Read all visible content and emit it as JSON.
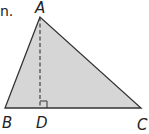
{
  "caption_fragment": "n.",
  "diagram": {
    "type": "triangle-with-altitude",
    "vertices": {
      "A": {
        "label": "A",
        "x": 40,
        "y": 17
      },
      "B": {
        "label": "B",
        "x": 5,
        "y": 108
      },
      "C": {
        "label": "C",
        "x": 141,
        "y": 108
      },
      "D": {
        "label": "D",
        "x": 40,
        "y": 108
      }
    },
    "altitude": {
      "from": "A",
      "to": "D",
      "style": "dashed"
    },
    "right_angle_at": "D",
    "colors": {
      "fill": "#d6d6d6",
      "stroke": "#333333",
      "label": "#222222"
    }
  }
}
